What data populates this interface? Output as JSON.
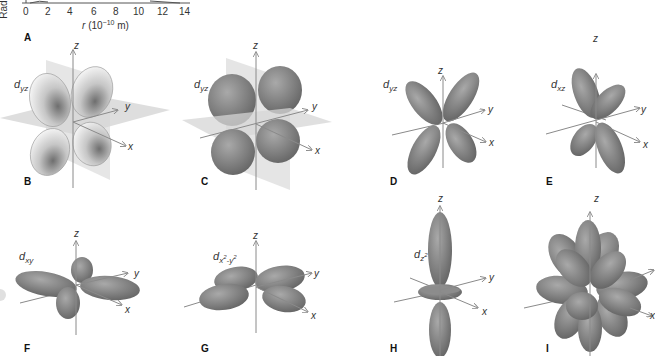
{
  "figure": {
    "panel_a": {
      "label": "A",
      "y_axis_label_fragment": "Rad",
      "x_ticks": [
        "0",
        "2",
        "4",
        "6",
        "8",
        "10",
        "12",
        "14"
      ],
      "x_axis_label": "r (10",
      "x_axis_exponent": "−10",
      "x_axis_unit": " m)"
    },
    "panels": [
      {
        "id": "B",
        "label": "B",
        "orbital": "d",
        "orbital_sub": "yz",
        "style": "cross-section with planes"
      },
      {
        "id": "C",
        "label": "C",
        "orbital": "d",
        "orbital_sub": "yz",
        "style": "solid lobes with planes"
      },
      {
        "id": "D",
        "label": "D",
        "orbital": "d",
        "orbital_sub": "yz",
        "style": "lobes"
      },
      {
        "id": "E",
        "label": "E",
        "orbital": "d",
        "orbital_sub": "xz",
        "style": "lobes"
      },
      {
        "id": "F",
        "label": "F",
        "orbital": "d",
        "orbital_sub": "xy",
        "style": "lobes"
      },
      {
        "id": "G",
        "label": "G",
        "orbital": "d",
        "orbital_sub": "x",
        "orbital_sub_sup": "2",
        "orbital_sub2": "-y",
        "orbital_sub2_sup": "2",
        "style": "lobes"
      },
      {
        "id": "H",
        "label": "H",
        "orbital": "d",
        "orbital_sub": "z",
        "orbital_sub_sup": "2",
        "style": "lobes with torus"
      },
      {
        "id": "I",
        "label": "I",
        "orbital": "",
        "orbital_sub": "",
        "style": "superposition of all d orbitals"
      }
    ],
    "axes": {
      "x": "x",
      "y": "y",
      "z": "z"
    },
    "colors": {
      "lobe": "#7d7d7d",
      "lobe_highlight": "#a8a8a8",
      "lobe_dark": "#5a5a5a",
      "plane": "#d8d8d8",
      "axis": "#8a8a8a",
      "text": "#222222"
    }
  }
}
